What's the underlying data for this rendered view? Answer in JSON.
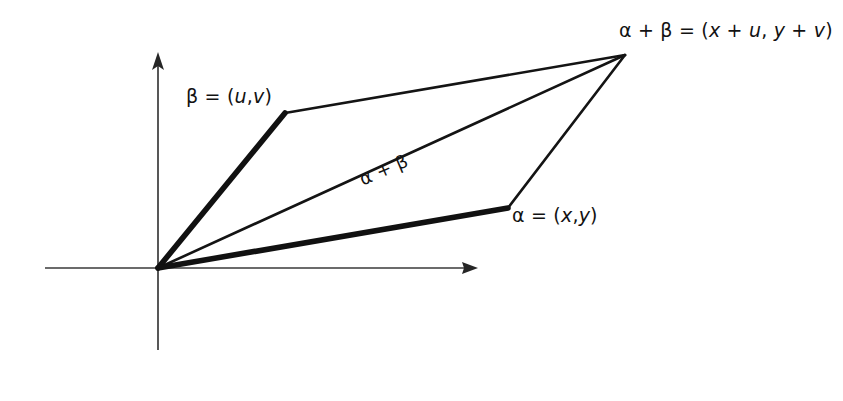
{
  "figure": {
    "kind": "vector-addition-parallelogram",
    "background_color": "#ffffff",
    "ink_color": "#141414",
    "axis_color": "#3a3a3a",
    "labels": {
      "sum_point": "α + β = (x + u, y + v)",
      "beta_vector": "β = (u,v)",
      "alpha_vector": "α = (x,y)",
      "diagonal": "α + β"
    }
  },
  "chart_data": {
    "type": "scatter",
    "title": "",
    "xlabel": "",
    "ylabel": "",
    "grid": false,
    "legend": "none",
    "axes": {
      "x_axis": {
        "from": [
          45,
          268
        ],
        "to": [
          478,
          268
        ],
        "arrow": "right"
      },
      "y_axis": {
        "from": [
          158,
          350
        ],
        "to": [
          158,
          52
        ],
        "arrow": "up"
      },
      "origin": [
        158,
        268
      ]
    },
    "points": [
      {
        "name": "origin",
        "label": "",
        "x": 158,
        "y": 268
      },
      {
        "name": "beta-tip",
        "label": "β = (u,v)",
        "x": 285,
        "y": 113
      },
      {
        "name": "alpha-tip",
        "label": "α = (x,y)",
        "x": 508,
        "y": 208
      },
      {
        "name": "sum-point",
        "label": "α + β = (x + u, y + v)",
        "x": 625,
        "y": 55
      }
    ],
    "segments": [
      {
        "name": "beta-vector",
        "from": "origin",
        "to": "beta-tip",
        "weight": "thick",
        "width": 5.5
      },
      {
        "name": "alpha-vector",
        "from": "origin",
        "to": "alpha-tip",
        "weight": "thick",
        "width": 5.5
      },
      {
        "name": "sum-diagonal",
        "from": "origin",
        "to": "sum-point",
        "weight": "thin",
        "width": 2.4
      },
      {
        "name": "beta-to-sum-side",
        "from": "beta-tip",
        "to": "sum-point",
        "weight": "thin",
        "width": 2.4
      },
      {
        "name": "alpha-to-sum-side",
        "from": "alpha-tip",
        "to": "sum-point",
        "weight": "thin",
        "width": 2.4
      }
    ]
  }
}
